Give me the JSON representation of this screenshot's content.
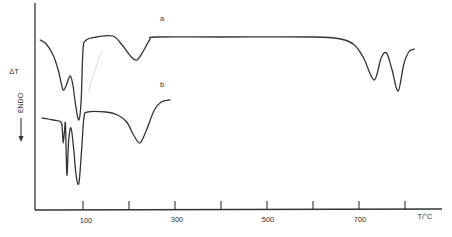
{
  "chart_data": {
    "type": "line",
    "title": "",
    "xlabel": "T/°C",
    "ylabel": "ΔT",
    "y_annotation": "ENDO",
    "y_annotation_arrow": "down",
    "xlim": [
      -5,
      860
    ],
    "x_ticks": [
      100,
      200,
      300,
      400,
      500,
      600,
      700,
      800
    ],
    "x_tick_labels": [
      {
        "value": 100,
        "label": "100"
      },
      {
        "value": 300,
        "label": "300"
      },
      {
        "value": 500,
        "label": "500"
      },
      {
        "value": 700,
        "label": "700"
      }
    ],
    "grid": false,
    "legend": "inline curve labels",
    "units_note": "ΔT in arbitrary relative units (higher = exothermic direction); endothermic peaks point down",
    "series": [
      {
        "name": "a",
        "points": [
          {
            "T": 7,
            "dT": 170
          },
          {
            "T": 20,
            "dT": 166
          },
          {
            "T": 35,
            "dT": 155
          },
          {
            "T": 46,
            "dT": 140
          },
          {
            "T": 52,
            "dT": 128
          },
          {
            "T": 57,
            "dT": 120
          },
          {
            "T": 63,
            "dT": 124
          },
          {
            "T": 72,
            "dT": 134
          },
          {
            "T": 78,
            "dT": 125
          },
          {
            "T": 84,
            "dT": 105
          },
          {
            "T": 91,
            "dT": 90
          },
          {
            "T": 96,
            "dT": 110
          },
          {
            "T": 100,
            "dT": 160
          },
          {
            "T": 107,
            "dT": 170
          },
          {
            "T": 130,
            "dT": 173
          },
          {
            "T": 165,
            "dT": 174
          },
          {
            "T": 185,
            "dT": 165
          },
          {
            "T": 205,
            "dT": 153
          },
          {
            "T": 217,
            "dT": 150
          },
          {
            "T": 230,
            "dT": 158
          },
          {
            "T": 245,
            "dT": 170
          },
          {
            "T": 260,
            "dT": 173
          },
          {
            "T": 400,
            "dT": 173
          },
          {
            "T": 600,
            "dT": 173
          },
          {
            "T": 660,
            "dT": 171
          },
          {
            "T": 690,
            "dT": 165
          },
          {
            "T": 710,
            "dT": 152
          },
          {
            "T": 733,
            "dT": 130
          },
          {
            "T": 748,
            "dT": 152
          },
          {
            "T": 760,
            "dT": 157
          },
          {
            "T": 772,
            "dT": 140
          },
          {
            "T": 785,
            "dT": 119
          },
          {
            "T": 797,
            "dT": 145
          },
          {
            "T": 808,
            "dT": 158
          },
          {
            "T": 820,
            "dT": 161
          }
        ],
        "endothermic_peaks_T": [
          57,
          91,
          217,
          733,
          785
        ]
      },
      {
        "name": "b",
        "points": [
          {
            "T": 11,
            "dT": 92
          },
          {
            "T": 35,
            "dT": 90
          },
          {
            "T": 52,
            "dT": 88
          },
          {
            "T": 55,
            "dT": 80
          },
          {
            "T": 57,
            "dT": 67
          },
          {
            "T": 60,
            "dT": 80
          },
          {
            "T": 62,
            "dT": 85
          },
          {
            "T": 65,
            "dT": 35
          },
          {
            "T": 69,
            "dT": 70
          },
          {
            "T": 74,
            "dT": 82
          },
          {
            "T": 80,
            "dT": 60
          },
          {
            "T": 85,
            "dT": 35
          },
          {
            "T": 91,
            "dT": 27
          },
          {
            "T": 97,
            "dT": 60
          },
          {
            "T": 102,
            "dT": 92
          },
          {
            "T": 110,
            "dT": 98
          },
          {
            "T": 150,
            "dT": 98
          },
          {
            "T": 175,
            "dT": 95
          },
          {
            "T": 195,
            "dT": 88
          },
          {
            "T": 210,
            "dT": 75
          },
          {
            "T": 224,
            "dT": 67
          },
          {
            "T": 238,
            "dT": 80
          },
          {
            "T": 255,
            "dT": 100
          },
          {
            "T": 270,
            "dT": 108
          },
          {
            "T": 289,
            "dT": 110
          }
        ],
        "endothermic_peaks_T": [
          57,
          65,
          91,
          224
        ]
      }
    ]
  },
  "labels": {
    "y_axis": "ΔT",
    "endo": "ENDO",
    "x_axis": "T/°C",
    "series_a": "a",
    "series_b": "b",
    "tick_100": "100",
    "tick_300": "300",
    "tick_500": "500",
    "tick_700": "700"
  }
}
